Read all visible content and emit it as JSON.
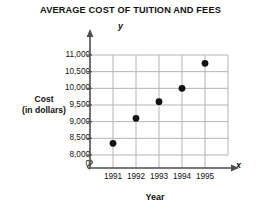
{
  "chart_data": {
    "type": "scatter",
    "title": "AVERAGE COST OF TUITION AND FEES",
    "xlabel": "Year",
    "ylabel": "Cost (in dollars)",
    "ylabel_line1": "Cost",
    "ylabel_line2": "(in dollars)",
    "x_axis_letter": "x",
    "y_axis_letter": "y",
    "categories": [
      "1991",
      "1992",
      "1993",
      "1994",
      "1995"
    ],
    "x": [
      1991,
      1992,
      1993,
      1994,
      1995
    ],
    "values": [
      8350,
      9100,
      9600,
      10000,
      10750
    ],
    "ylim": [
      8000,
      11000
    ],
    "ytick_labels": [
      "11,000",
      "10,500",
      "10,000",
      "9,500",
      "9,000",
      "8,500",
      "8,000",
      "0"
    ],
    "yticks": [
      11000,
      10500,
      10000,
      9500,
      9000,
      8500,
      8000,
      0
    ],
    "xtick_labels": [
      "1991",
      "1992",
      "1993",
      "1994",
      "1995"
    ],
    "grid": true,
    "axis_break": true,
    "legend": "none",
    "marker": "filled-circle",
    "marker_color": "#111111",
    "grid_color": "#b4b4b4",
    "axis_color": "#4d4d4d"
  }
}
